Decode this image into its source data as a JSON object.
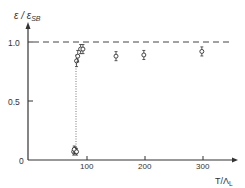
{
  "chart_data": {
    "type": "scatter",
    "title": "",
    "xlabel": "T/Λ_L",
    "ylabel": "ε/ε_SB",
    "xlim": [
      0,
      350
    ],
    "ylim": [
      0,
      1.15
    ],
    "x_ticks": [
      "100",
      "200",
      "300"
    ],
    "y_ticks": [
      "0",
      "0.5",
      "1.0"
    ],
    "grid": false,
    "legend": null,
    "reference_line": {
      "y": 1.0,
      "style": "dashed",
      "label": "Stefan-Boltzmann limit"
    },
    "transition_line": {
      "x": 82,
      "style": "dotted",
      "y_from": 0.06,
      "y_to": 0.88
    },
    "points": [
      {
        "x": 77,
        "y": 0.07,
        "err": 0.02
      },
      {
        "x": 80,
        "y": 0.08,
        "err": 0.02
      },
      {
        "x": 78,
        "y": 0.09,
        "err": 0.02
      },
      {
        "x": 82,
        "y": 0.07,
        "err": 0.02
      },
      {
        "x": 82,
        "y": 0.84,
        "err": 0.04
      },
      {
        "x": 84,
        "y": 0.88,
        "err": 0.04
      },
      {
        "x": 89,
        "y": 0.94,
        "err": 0.03
      },
      {
        "x": 93,
        "y": 0.94,
        "err": 0.03
      },
      {
        "x": 150,
        "y": 0.88,
        "err": 0.03
      },
      {
        "x": 198,
        "y": 0.89,
        "err": 0.03
      },
      {
        "x": 298,
        "y": 0.92,
        "err": 0.03
      }
    ]
  },
  "labels": {
    "y_axis_main": "ε / ε",
    "y_axis_sub": "SB",
    "x_axis_main": "T/Λ",
    "x_axis_sub": "L",
    "y_tick_0": "0",
    "y_tick_05": "0.5",
    "y_tick_1": "1.0",
    "x_tick_100": "100",
    "x_tick_200": "200",
    "x_tick_300": "300"
  }
}
